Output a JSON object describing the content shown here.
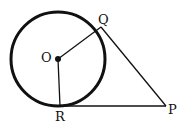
{
  "diagram": {
    "type": "geometry-circle-tangents",
    "points": {
      "O": {
        "label": "O",
        "x": 58,
        "y": 59
      },
      "Q": {
        "label": "Q",
        "x": 101,
        "y": 28
      },
      "R": {
        "label": "R",
        "x": 60,
        "y": 106
      },
      "P": {
        "label": "P",
        "x": 167,
        "y": 106
      }
    },
    "circle": {
      "center": "O",
      "radius": 48
    },
    "segments": [
      "OQ",
      "OR",
      "QP",
      "RP"
    ],
    "stroke_color": "#111111"
  }
}
